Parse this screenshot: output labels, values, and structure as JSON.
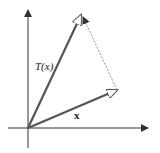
{
  "diagram": {
    "labels": {
      "transformed_vector": "T(x)",
      "vector": "x"
    },
    "colors": {
      "axes": "#333333",
      "vectors": "#555555",
      "dashed": "#777777"
    }
  }
}
